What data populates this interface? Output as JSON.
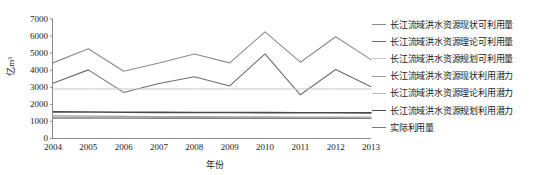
{
  "chart_data": {
    "type": "line",
    "title": "",
    "xlabel": "年份",
    "ylabel": "亿m³",
    "x": [
      2004,
      2005,
      2006,
      2007,
      2008,
      2009,
      2010,
      2011,
      2012,
      2013
    ],
    "xtick_labels": [
      "2004",
      "2005",
      "2006",
      "2007",
      "2008",
      "2009",
      "2010",
      "2011",
      "2012",
      "2013"
    ],
    "ytick_labels": [
      "0",
      "1000",
      "2000",
      "3000",
      "4000",
      "5000",
      "6000",
      "7000"
    ],
    "yticks": [
      0,
      1000,
      2000,
      3000,
      4000,
      5000,
      6000,
      7000
    ],
    "ylim": [
      0,
      7000
    ],
    "xlim": [
      2004,
      2013
    ],
    "grid": false,
    "legend_position": "right",
    "series": [
      {
        "name": "长江流域洪水资源现状可利用量",
        "color": "#8c8c8c",
        "values": [
          4430,
          5260,
          3940,
          4420,
          4950,
          4430,
          6250,
          4470,
          5960,
          4620
        ]
      },
      {
        "name": "长江流域洪水资源理论可利用量",
        "color": "#6e6e6e",
        "values": [
          3230,
          4020,
          2700,
          3220,
          3620,
          3080,
          4960,
          2560,
          4040,
          3030
        ]
      },
      {
        "name": "长江流域洪水资源规划可利用量",
        "color": "#c9c9c9",
        "values": [
          2900,
          2900,
          2900,
          2900,
          2900,
          2900,
          2900,
          2900,
          2900,
          2900
        ]
      },
      {
        "name": "长江流域洪水资源现状利用潜力",
        "color": "#9a9a9a",
        "values": [
          1320,
          1310,
          1300,
          1290,
          1280,
          1270,
          1265,
          1260,
          1255,
          1250
        ]
      },
      {
        "name": "长江流域洪水资源理论利用潜力",
        "color": "#bdbdbd",
        "values": [
          1250,
          1245,
          1240,
          1235,
          1230,
          1225,
          1220,
          1215,
          1212,
          1210
        ]
      },
      {
        "name": "长江流域洪水资源规划利用潜力",
        "color": "#4a4a4a",
        "values": [
          1560,
          1550,
          1540,
          1530,
          1525,
          1520,
          1515,
          1510,
          1505,
          1500
        ]
      },
      {
        "name": "实际利用量",
        "color": "#7a7a7a",
        "values": [
          1190,
          1188,
          1186,
          1184,
          1182,
          1180,
          1178,
          1176,
          1174,
          1172
        ]
      }
    ]
  },
  "axes": {
    "axis_color": "#808080"
  }
}
